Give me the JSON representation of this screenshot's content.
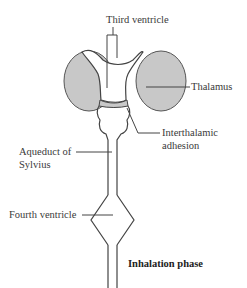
{
  "diagram": {
    "caption": "Inhalation phase",
    "labels": {
      "third_ventricle": "Third ventricle",
      "thalamus": "Thalamus",
      "interthalamic_line1": "Interthalamic",
      "interthalamic_line2": "adhesion",
      "aqueduct_line1": "Aqueduct of",
      "aqueduct_line2": "Sylvius",
      "fourth_ventricle": "Fourth ventricle"
    },
    "colors": {
      "thalamus_fill": "#c8c8c8",
      "stroke": "#444444"
    }
  }
}
